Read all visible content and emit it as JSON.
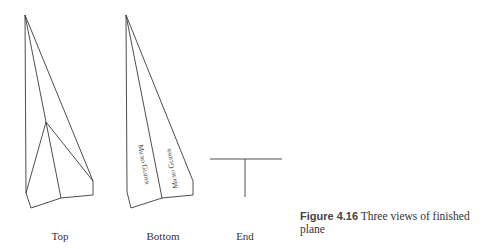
{
  "figure": {
    "views": [
      {
        "id": "top",
        "label": "Top"
      },
      {
        "id": "bottom",
        "label": "Bottom"
      },
      {
        "id": "end",
        "label": "End"
      }
    ],
    "wing_text": {
      "left": "Micro Glider",
      "right": "Micro Glider"
    },
    "caption": {
      "number": "Figure 4.16",
      "text": "Three views of finished plane"
    },
    "line_color": "#3a3a3a"
  }
}
